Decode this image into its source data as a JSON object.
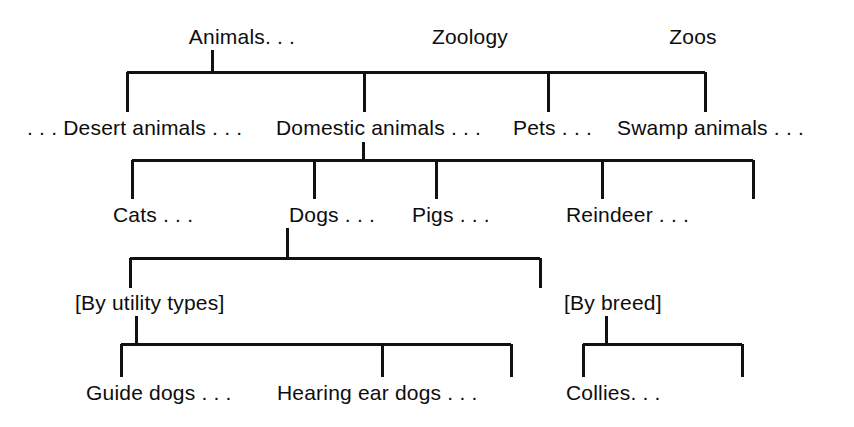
{
  "diagram": {
    "background_color": "#ffffff",
    "line_color": "#111111",
    "text_color": "#0d0d0d",
    "levels": [
      {
        "level": 1,
        "name": "top-terms",
        "nodes": [
          {
            "id": "animals",
            "label": "Animals. . .",
            "x": 242,
            "y": 44,
            "anchor": "middle"
          },
          {
            "id": "zoology",
            "label": "Zoology",
            "x": 470,
            "y": 44,
            "anchor": "middle"
          },
          {
            "id": "zoos",
            "label": "Zoos",
            "x": 693,
            "y": 44,
            "anchor": "middle"
          }
        ]
      },
      {
        "level": 2,
        "name": "animal-categories",
        "nodes": [
          {
            "id": "desert-animals",
            "label": ". . . Desert animals . . .",
            "x": 27,
            "y": 135,
            "anchor": "start"
          },
          {
            "id": "domestic-animals",
            "label": "Domestic animals . . .",
            "x": 276,
            "y": 135,
            "anchor": "start"
          },
          {
            "id": "pets",
            "label": "Pets . . .",
            "x": 513,
            "y": 135,
            "anchor": "start"
          },
          {
            "id": "swamp-animals",
            "label": "Swamp animals . . .",
            "x": 617,
            "y": 135,
            "anchor": "start"
          }
        ]
      },
      {
        "level": 3,
        "name": "domestic-animal-kinds",
        "nodes": [
          {
            "id": "cats",
            "label": "Cats . . .",
            "x": 113,
            "y": 222,
            "anchor": "start"
          },
          {
            "id": "dogs",
            "label": "Dogs . . .",
            "x": 289,
            "y": 222,
            "anchor": "start"
          },
          {
            "id": "pigs",
            "label": "Pigs . . .",
            "x": 412,
            "y": 222,
            "anchor": "start"
          },
          {
            "id": "reindeer",
            "label": "Reindeer . . .",
            "x": 566,
            "y": 222,
            "anchor": "start"
          }
        ]
      },
      {
        "level": 4,
        "name": "dog-facets",
        "nodes": [
          {
            "id": "by-utility-types",
            "label": "[By utility types]",
            "x": 75,
            "y": 310,
            "anchor": "start"
          },
          {
            "id": "by-breed",
            "label": "[By breed]",
            "x": 564,
            "y": 310,
            "anchor": "start"
          }
        ]
      },
      {
        "level": 5,
        "name": "dog-leaf-terms",
        "nodes": [
          {
            "id": "guide-dogs",
            "label": "Guide dogs . . .",
            "x": 86,
            "y": 400,
            "anchor": "start"
          },
          {
            "id": "hearing-ear-dogs",
            "label": "Hearing ear dogs . . .",
            "x": 277,
            "y": 400,
            "anchor": "start"
          },
          {
            "id": "collies",
            "label": "Collies. . .",
            "x": 566,
            "y": 400,
            "anchor": "start"
          }
        ]
      }
    ],
    "connectors": [
      {
        "id": "animals-stem",
        "type": "stem",
        "points": "212,50 212,72"
      },
      {
        "id": "bracket-1-bar",
        "type": "bar",
        "points": "127,72 705,72"
      },
      {
        "id": "bracket-1-drop-desert",
        "type": "drop",
        "points": "127,72 127,112"
      },
      {
        "id": "bracket-1-drop-domestic",
        "type": "drop",
        "points": "364,72 364,112"
      },
      {
        "id": "bracket-1-drop-pets",
        "type": "drop",
        "points": "548,72 548,112"
      },
      {
        "id": "bracket-1-drop-swamp",
        "type": "drop",
        "points": "705,72 705,112"
      },
      {
        "id": "domestic-stem",
        "type": "stem",
        "points": "363,142 363,160"
      },
      {
        "id": "bracket-2-bar",
        "type": "bar",
        "points": "132,160 753,160"
      },
      {
        "id": "bracket-2-drop-cats",
        "type": "drop",
        "points": "132,160 132,199"
      },
      {
        "id": "bracket-2-drop-dogs",
        "type": "drop",
        "points": "314,160 314,199"
      },
      {
        "id": "bracket-2-drop-pigs",
        "type": "drop",
        "points": "436,160 436,199"
      },
      {
        "id": "bracket-2-drop-reindeer",
        "type": "drop",
        "points": "602,160 602,199"
      },
      {
        "id": "bracket-2-drop-end",
        "type": "drop",
        "points": "753,160 753,199"
      },
      {
        "id": "dogs-stem",
        "type": "stem",
        "points": "287,228 287,258"
      },
      {
        "id": "bracket-3-bar",
        "type": "bar",
        "points": "130,258 540,258"
      },
      {
        "id": "bracket-3-drop-utility",
        "type": "drop",
        "points": "130,258 130,288"
      },
      {
        "id": "bracket-3-drop-breed",
        "type": "drop",
        "points": "540,258 540,288"
      },
      {
        "id": "utility-stem",
        "type": "stem",
        "points": "136,316 136,344"
      },
      {
        "id": "bracket-4-bar",
        "type": "bar",
        "points": "121,344 511,344"
      },
      {
        "id": "bracket-4-drop-guide",
        "type": "drop",
        "points": "121,344 121,377"
      },
      {
        "id": "bracket-4-drop-hearing",
        "type": "drop",
        "points": "382,344 382,377"
      },
      {
        "id": "bracket-4-drop-end",
        "type": "drop",
        "points": "511,344 511,377"
      },
      {
        "id": "breed-stem",
        "type": "stem",
        "points": "606,316 606,344"
      },
      {
        "id": "bracket-5-bar",
        "type": "bar",
        "points": "583,344 742,344"
      },
      {
        "id": "bracket-5-drop-collies",
        "type": "drop",
        "points": "583,344 583,377"
      },
      {
        "id": "bracket-5-drop-end",
        "type": "drop",
        "points": "742,344 742,377"
      }
    ]
  }
}
